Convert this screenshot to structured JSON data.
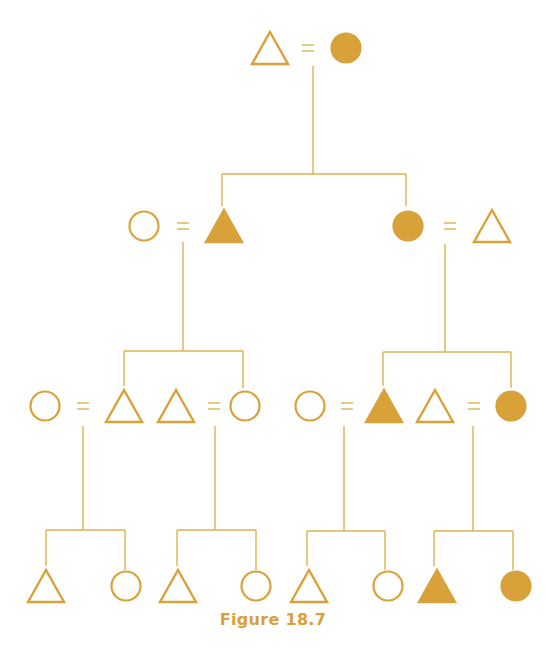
{
  "figure": {
    "caption": "Figure 18.7",
    "colors": {
      "shape": "#D9A13A",
      "line": "#DDB24C",
      "caption": "#D9A13A"
    },
    "legend_semantics": {
      "triangle": "male",
      "circle": "female",
      "filled": "highlighted kin",
      "equals": "marriage"
    }
  },
  "diagram": {
    "nodes": [
      {
        "id": "g1-m",
        "shape": "triangle",
        "filled": false,
        "x": 270,
        "y": 48
      },
      {
        "id": "g1-f",
        "shape": "circle",
        "filled": true,
        "x": 346,
        "y": 48
      },
      {
        "id": "g2-wife-left",
        "shape": "circle",
        "filled": false,
        "x": 144,
        "y": 226
      },
      {
        "id": "g2-son",
        "shape": "triangle",
        "filled": true,
        "x": 224,
        "y": 226
      },
      {
        "id": "g2-daughter",
        "shape": "circle",
        "filled": true,
        "x": 408,
        "y": 226
      },
      {
        "id": "g2-husband-right",
        "shape": "triangle",
        "filled": false,
        "x": 492,
        "y": 226
      },
      {
        "id": "g3-a-wife",
        "shape": "circle",
        "filled": false,
        "x": 45,
        "y": 406
      },
      {
        "id": "g3-a",
        "shape": "triangle",
        "filled": false,
        "x": 124,
        "y": 406
      },
      {
        "id": "g3-b-husband",
        "shape": "triangle",
        "filled": false,
        "x": 176,
        "y": 406
      },
      {
        "id": "g3-b",
        "shape": "circle",
        "filled": false,
        "x": 245,
        "y": 406
      },
      {
        "id": "g3-c-wife",
        "shape": "circle",
        "filled": false,
        "x": 310,
        "y": 406
      },
      {
        "id": "g3-c",
        "shape": "triangle",
        "filled": true,
        "x": 384,
        "y": 406
      },
      {
        "id": "g3-d-husband",
        "shape": "triangle",
        "filled": false,
        "x": 435,
        "y": 406
      },
      {
        "id": "g3-d",
        "shape": "circle",
        "filled": true,
        "x": 511,
        "y": 406
      },
      {
        "id": "g4-1",
        "shape": "triangle",
        "filled": false,
        "x": 46,
        "y": 586
      },
      {
        "id": "g4-2",
        "shape": "circle",
        "filled": false,
        "x": 126,
        "y": 586
      },
      {
        "id": "g4-3",
        "shape": "triangle",
        "filled": false,
        "x": 178,
        "y": 586
      },
      {
        "id": "g4-4",
        "shape": "circle",
        "filled": false,
        "x": 256,
        "y": 586
      },
      {
        "id": "g4-5",
        "shape": "triangle",
        "filled": false,
        "x": 309,
        "y": 586
      },
      {
        "id": "g4-6",
        "shape": "circle",
        "filled": false,
        "x": 388,
        "y": 586
      },
      {
        "id": "g4-7",
        "shape": "triangle",
        "filled": true,
        "x": 437,
        "y": 586
      },
      {
        "id": "g4-8",
        "shape": "circle",
        "filled": true,
        "x": 516,
        "y": 586
      }
    ],
    "marriages": [
      {
        "x": 308,
        "y": 48
      },
      {
        "x": 183,
        "y": 226
      },
      {
        "x": 450,
        "y": 226
      },
      {
        "x": 83,
        "y": 406
      },
      {
        "x": 214,
        "y": 406
      },
      {
        "x": 347,
        "y": 406
      },
      {
        "x": 474,
        "y": 406
      }
    ],
    "lines": [
      [
        313,
        66,
        313,
        174
      ],
      [
        222,
        174,
        406,
        174
      ],
      [
        222,
        174,
        222,
        206
      ],
      [
        406,
        174,
        406,
        206
      ],
      [
        183,
        242,
        183,
        351
      ],
      [
        124,
        351,
        243,
        351
      ],
      [
        124,
        351,
        124,
        386
      ],
      [
        243,
        351,
        243,
        388
      ],
      [
        445,
        244,
        445,
        352
      ],
      [
        383,
        352,
        511,
        352
      ],
      [
        383,
        352,
        383,
        386
      ],
      [
        511,
        352,
        511,
        388
      ],
      [
        83,
        426,
        83,
        530
      ],
      [
        46,
        530,
        125,
        530
      ],
      [
        46,
        530,
        46,
        566
      ],
      [
        125,
        530,
        125,
        570
      ],
      [
        215,
        426,
        215,
        530
      ],
      [
        177,
        530,
        256,
        530
      ],
      [
        177,
        530,
        177,
        566
      ],
      [
        256,
        530,
        256,
        570
      ],
      [
        344,
        426,
        344,
        531
      ],
      [
        307,
        531,
        385,
        531
      ],
      [
        307,
        531,
        307,
        566
      ],
      [
        385,
        531,
        385,
        570
      ],
      [
        473,
        426,
        473,
        531
      ],
      [
        434,
        531,
        513,
        531
      ],
      [
        434,
        531,
        434,
        566
      ],
      [
        513,
        531,
        513,
        570
      ]
    ]
  }
}
